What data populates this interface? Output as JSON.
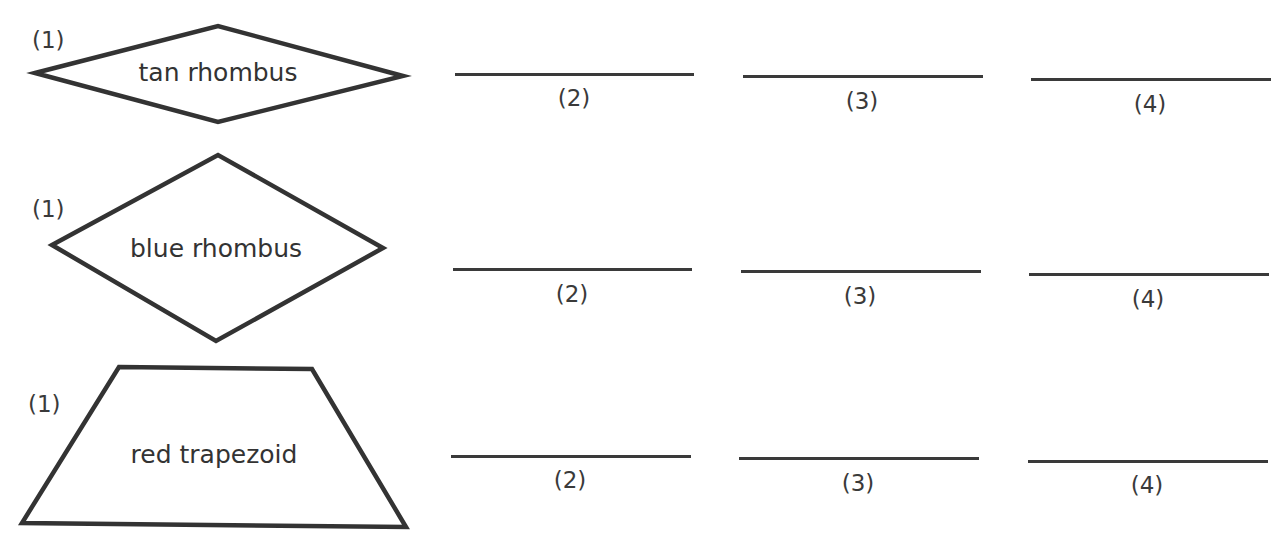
{
  "rows": [
    {
      "shape": "rhombus",
      "label": "tan rhombus",
      "number": "(1)",
      "answers": [
        "(2)",
        "(3)",
        "(4)"
      ]
    },
    {
      "shape": "rhombus",
      "label": "blue rhombus",
      "number": "(1)",
      "answers": [
        "(2)",
        "(3)",
        "(4)"
      ]
    },
    {
      "shape": "trapezoid",
      "label": "red trapezoid",
      "number": "(1)",
      "answers": [
        "(2)",
        "(3)",
        "(4)"
      ]
    }
  ],
  "colors": {
    "stroke": "#333333",
    "background": "#ffffff"
  }
}
